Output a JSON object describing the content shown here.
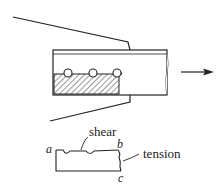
{
  "diagram": {
    "type": "block-shear-connection",
    "arrow_direction": "right",
    "bolts_count": 3,
    "labels": {
      "shear": "shear",
      "tension": "tension",
      "a": "a",
      "b": "b",
      "c": "c"
    },
    "colors": {
      "line": "#222222",
      "background": "#ffffff"
    }
  }
}
